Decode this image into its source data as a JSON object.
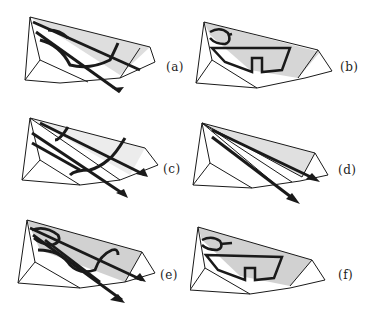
{
  "figure": {
    "panels": [
      {
        "id": "a",
        "label": "(a)",
        "content": "wedge with leading-edge vortex lines and arrows, shaded upper surface"
      },
      {
        "id": "b",
        "label": "(b)",
        "content": "wedge with shaded surface and closed flow-separation pattern"
      },
      {
        "id": "c",
        "label": "(c)",
        "content": "wedge with streamline arrows and crossflow lines"
      },
      {
        "id": "d",
        "label": "(d)",
        "content": "wedge with radial rays from apex and two arrows"
      },
      {
        "id": "e",
        "label": "(e)",
        "content": "wedge with dense vortex lines and arrows, shaded surface"
      },
      {
        "id": "f",
        "label": "(f)",
        "content": "wedge with shaded surface and closed flow-separation pattern"
      }
    ],
    "colors": {
      "ink": "#1a1a1a",
      "shade": "#bdbdbd",
      "background": "#ffffff"
    }
  }
}
